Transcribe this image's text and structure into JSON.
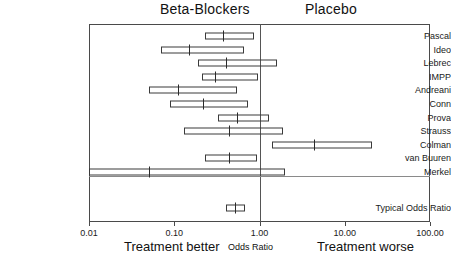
{
  "headers": {
    "left_group": "Beta-Blockers",
    "right_group": "Placebo"
  },
  "footer": {
    "better": "Treatment better",
    "axis_title": "Odds Ratio",
    "worse": "Treatment worse"
  },
  "axis": {
    "ticks": [
      "0.01",
      "0.10",
      "1.00",
      "10.00",
      "100.00"
    ],
    "tick_values": [
      0.01,
      0.1,
      1,
      10,
      100
    ]
  },
  "chart_data": {
    "type": "forest",
    "title": "",
    "xlabel": "Odds Ratio",
    "ylabel": "",
    "scale": "log",
    "xlim": [
      0.01,
      100
    ],
    "null_value": 1.0,
    "grid": false,
    "legend": "none",
    "annotations": [
      "Beta-Blockers",
      "Placebo",
      "Treatment better",
      "Treatment worse"
    ],
    "tick_labels": [
      "0.01",
      "0.10",
      "1.00",
      "10.00",
      "100.00"
    ],
    "categories": [
      "Pascal",
      "Ideo",
      "Lebrec",
      "IMPP",
      "Andreani",
      "Conn",
      "Prova",
      "Strauss",
      "Colman",
      "van Buuren",
      "Merkel",
      "Typical Odds Ratio"
    ],
    "rows": [
      {
        "label": "Pascal",
        "or": 0.37,
        "ci_low": 0.23,
        "ci_high": 0.86,
        "summary": false
      },
      {
        "label": "Ideo",
        "or": 0.15,
        "ci_low": 0.07,
        "ci_high": 0.66,
        "summary": false
      },
      {
        "label": "Lebrec",
        "or": 0.4,
        "ci_low": 0.19,
        "ci_high": 1.6,
        "summary": false
      },
      {
        "label": "IMPP",
        "or": 0.3,
        "ci_low": 0.21,
        "ci_high": 0.95,
        "summary": false
      },
      {
        "label": "Andreani",
        "or": 0.11,
        "ci_low": 0.05,
        "ci_high": 0.55,
        "summary": false
      },
      {
        "label": "Conn",
        "or": 0.22,
        "ci_low": 0.09,
        "ci_high": 0.73,
        "summary": false
      },
      {
        "label": "Prova",
        "or": 0.55,
        "ci_low": 0.33,
        "ci_high": 1.3,
        "summary": false
      },
      {
        "label": "Strauss",
        "or": 0.44,
        "ci_low": 0.13,
        "ci_high": 1.9,
        "summary": false
      },
      {
        "label": "Colman",
        "or": 4.4,
        "ci_low": 1.4,
        "ci_high": 21.0,
        "summary": false
      },
      {
        "label": "van Buuren",
        "or": 0.44,
        "ci_low": 0.23,
        "ci_high": 0.94,
        "summary": false
      },
      {
        "label": "Merkel",
        "or": 0.05,
        "ci_low": 0.01,
        "ci_high": 2.0,
        "summary": false
      },
      {
        "label": "Typical Odds Ratio",
        "or": 0.51,
        "ci_low": 0.4,
        "ci_high": 0.67,
        "summary": true
      }
    ]
  }
}
